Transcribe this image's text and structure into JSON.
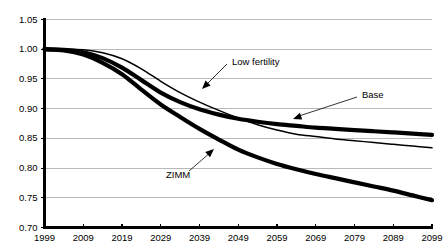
{
  "chart_data": {
    "type": "line",
    "title": "",
    "subtitle": "",
    "xlabel": "",
    "ylabel": "",
    "xlim": [
      1999,
      2099
    ],
    "ylim": [
      0.7,
      1.05
    ],
    "grid": true,
    "legend_position": "inline-annotations",
    "x_ticks": [
      "1999",
      "2009",
      "2019",
      "2029",
      "2039",
      "2049",
      "2059",
      "2069",
      "2079",
      "2089",
      "2099"
    ],
    "y_ticks": [
      "0.70",
      "0.75",
      "0.80",
      "0.85",
      "0.90",
      "0.95",
      "1.00",
      "1.05"
    ],
    "x": [
      1999,
      2004,
      2009,
      2014,
      2019,
      2024,
      2029,
      2034,
      2039,
      2044,
      2049,
      2054,
      2059,
      2064,
      2069,
      2074,
      2079,
      2084,
      2089,
      2094,
      2099
    ],
    "series": [
      {
        "name": "Low fertility",
        "style": "thin",
        "values": [
          1.0,
          1.0,
          0.999,
          0.994,
          0.984,
          0.967,
          0.946,
          0.927,
          0.911,
          0.897,
          0.884,
          0.873,
          0.864,
          0.857,
          0.853,
          0.849,
          0.846,
          0.843,
          0.84,
          0.837,
          0.834
        ]
      },
      {
        "name": "Base",
        "style": "thick",
        "values": [
          1.0,
          0.999,
          0.995,
          0.985,
          0.969,
          0.948,
          0.927,
          0.911,
          0.899,
          0.89,
          0.883,
          0.878,
          0.874,
          0.871,
          0.868,
          0.866,
          0.864,
          0.862,
          0.86,
          0.858,
          0.856
        ]
      },
      {
        "name": "ZIMM",
        "style": "thick",
        "values": [
          1.0,
          0.998,
          0.991,
          0.977,
          0.958,
          0.932,
          0.907,
          0.886,
          0.866,
          0.848,
          0.831,
          0.818,
          0.807,
          0.798,
          0.79,
          0.783,
          0.776,
          0.769,
          0.762,
          0.754,
          0.746
        ]
      }
    ],
    "annotations": [
      {
        "id": "low-fertility",
        "text": "Low fertility",
        "label_x": 232,
        "label_y": 62,
        "leader_from_x": 227,
        "leader_from_y": 64,
        "leader_to_x": 205,
        "leader_to_y": 86,
        "arrow_x": 202,
        "arrow_y": 89,
        "arrow_dir": "down-left"
      },
      {
        "id": "base",
        "text": "Base",
        "label_x": 362,
        "label_y": 95,
        "leader_from_x": 357,
        "leader_from_y": 97,
        "leader_to_x": 296,
        "leader_to_y": 117,
        "arrow_x": 293,
        "arrow_y": 119,
        "arrow_dir": "down-left"
      },
      {
        "id": "zimm",
        "text": "ZIMM",
        "label_x": 166,
        "label_y": 175,
        "leader_from_x": 189,
        "leader_from_y": 171,
        "leader_to_x": 211,
        "leader_to_y": 152,
        "arrow_x": 214,
        "arrow_y": 149,
        "arrow_dir": "up-right"
      }
    ],
    "colors": {
      "series": "#000000",
      "gridline": "#a8a8a8",
      "axis": "#000000",
      "background": "#ffffff"
    }
  }
}
